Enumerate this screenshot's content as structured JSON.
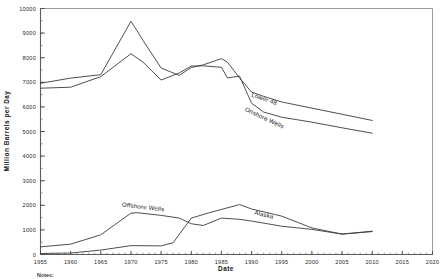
{
  "chart_data": {
    "type": "line",
    "title": "",
    "xlabel": "Date",
    "ylabel": "Million  Barrels  per  Day",
    "xlim": [
      1955,
      2020
    ],
    "ylim": [
      0,
      10000
    ],
    "grid": false,
    "legend_position": "inline-annotations",
    "x_ticks": [
      1955,
      1960,
      1965,
      1970,
      1975,
      1980,
      1985,
      1990,
      1995,
      2000,
      2005,
      2010,
      2015,
      2020
    ],
    "y_ticks": [
      0,
      1000,
      2000,
      3000,
      4000,
      5000,
      6000,
      7000,
      8000,
      9000,
      10000
    ],
    "x_minor_tick_step": 1,
    "y_minor_tick_step": 500,
    "series": [
      {
        "name": "Lower 48",
        "label_x": 1992,
        "label_y": 6250,
        "x": [
          1955,
          1960,
          1965,
          1970,
          1971,
          1972,
          1975,
          1978,
          1980,
          1982,
          1985,
          1986,
          1988,
          1990,
          1992,
          1995,
          2000,
          2005,
          2010
        ],
        "y": [
          6960,
          7170,
          7310,
          9480,
          9100,
          8700,
          7580,
          7280,
          7600,
          7710,
          7960,
          7820,
          7180,
          6600,
          6430,
          6200,
          5950,
          5700,
          5450
        ]
      },
      {
        "name": "Onshore Wells",
        "label_x": 1992,
        "label_y": 5480,
        "x": [
          1955,
          1960,
          1965,
          1970,
          1972,
          1975,
          1978,
          1980,
          1982,
          1985,
          1986,
          1988,
          1990,
          1992,
          1995,
          2000,
          2005,
          2010
        ],
        "y": [
          6760,
          6800,
          7230,
          8160,
          7820,
          7090,
          7380,
          7660,
          7670,
          7610,
          7180,
          7250,
          6150,
          5790,
          5580,
          5380,
          5150,
          4930
        ]
      },
      {
        "name": "Offshore Wells",
        "label_x": 1972,
        "label_y": 1850,
        "x": [
          1955,
          1960,
          1965,
          1970,
          1971,
          1975,
          1978,
          1980,
          1982,
          1985,
          1988,
          1990,
          1995,
          2000,
          2005,
          2010
        ],
        "y": [
          310,
          420,
          800,
          1680,
          1700,
          1590,
          1480,
          1250,
          1180,
          1480,
          1430,
          1360,
          1150,
          1020,
          830,
          930
        ]
      },
      {
        "name": "Alaska",
        "label_x": 1992,
        "label_y": 1540,
        "x": [
          1955,
          1960,
          1965,
          1970,
          1975,
          1977,
          1980,
          1983,
          1985,
          1988,
          1990,
          1995,
          2000,
          2005,
          2008,
          2010
        ],
        "y": [
          40,
          60,
          180,
          360,
          350,
          480,
          1480,
          1700,
          1830,
          2030,
          1850,
          1560,
          1080,
          830,
          900,
          950
        ]
      }
    ],
    "notes_label": "Notes:"
  }
}
